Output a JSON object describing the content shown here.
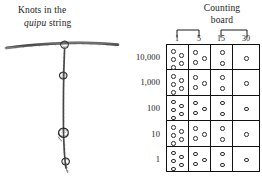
{
  "figure": {
    "left_panel": {
      "caption_line1": "Knots in the",
      "caption_line2_italic": "quipu",
      "caption_line2_rest": " string",
      "drawing_name": "quipu-string-illustration"
    },
    "right_panel": {
      "title_line1": "Counting",
      "title_line2": "board",
      "column_headers": [
        "1",
        "5",
        "15",
        "30"
      ],
      "brackets": [
        {
          "spans": [
            "1",
            "5"
          ]
        },
        {
          "spans": [
            "15",
            "30"
          ]
        }
      ],
      "row_labels": [
        "10,000",
        "1,000",
        "100",
        "10",
        "1"
      ]
    }
  },
  "chart_data": {
    "type": "table",
    "title": "Counting board",
    "xlabel": "",
    "ylabel": "",
    "categories": [
      "1",
      "5",
      "15",
      "30"
    ],
    "row_categories": [
      "10,000",
      "1,000",
      "100",
      "10",
      "1"
    ],
    "legend": [],
    "grid": true,
    "note": "Each cell shows the count of pebbles (circles) placed in that column for that decimal place.",
    "series": [
      {
        "name": "10,000",
        "values": [
          5,
          3,
          2,
          1
        ]
      },
      {
        "name": "1,000",
        "values": [
          5,
          3,
          2,
          1
        ]
      },
      {
        "name": "100",
        "values": [
          5,
          3,
          2,
          1
        ]
      },
      {
        "name": "10",
        "values": [
          5,
          3,
          2,
          1
        ]
      },
      {
        "name": "1",
        "values": [
          5,
          3,
          2,
          1
        ]
      }
    ],
    "pebble_layouts": {
      "1": [
        [
          4,
          4
        ],
        [
          4,
          12
        ],
        [
          4,
          20
        ],
        [
          12,
          8
        ],
        [
          12,
          16
        ]
      ],
      "5": [
        [
          4,
          5
        ],
        [
          4,
          15
        ],
        [
          13,
          11
        ]
      ],
      "15": [
        [
          9,
          5
        ],
        [
          9,
          16
        ]
      ],
      "30": [
        [
          11,
          11
        ]
      ]
    }
  },
  "colors": {
    "ink": "#1a1a1a",
    "rule": "#111111",
    "pebble_stroke": "#2b2b2b",
    "background": "#ffffff"
  }
}
